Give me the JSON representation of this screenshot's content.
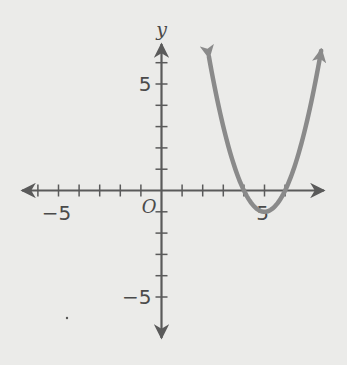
{
  "chart_data": {
    "type": "line",
    "title": "",
    "xlabel": "",
    "ylabel": "y",
    "origin_label": "O",
    "xlim": [
      -6.5,
      7.8
    ],
    "ylim": [
      -6.8,
      7.2
    ],
    "x_ticks": [
      -6,
      -5,
      -4,
      -3,
      -2,
      -1,
      1,
      2,
      3,
      4,
      5,
      6
    ],
    "y_ticks": [
      -5,
      -4,
      -3,
      -2,
      -1,
      1,
      2,
      3,
      4,
      5,
      6
    ],
    "x_tick_labels": [
      {
        "value": -5,
        "text": "−5"
      },
      {
        "value": 5,
        "text": "5"
      }
    ],
    "y_tick_labels": [
      {
        "value": 5,
        "text": "5"
      },
      {
        "value": -5,
        "text": "−5"
      }
    ],
    "grid": false,
    "series": [
      {
        "name": "parabola",
        "equation": "y = (x - 4)(x - 6)",
        "vertex": [
          5,
          -1
        ],
        "x_intercepts": [
          4,
          6
        ],
        "x_range": [
          2.3,
          7.75
        ],
        "color": "#8a8a8a",
        "arrows_both_ends": true
      }
    ]
  },
  "colors": {
    "background": "#ebebe9",
    "axis": "#5a5a5a",
    "curve": "#8a8a8a"
  }
}
